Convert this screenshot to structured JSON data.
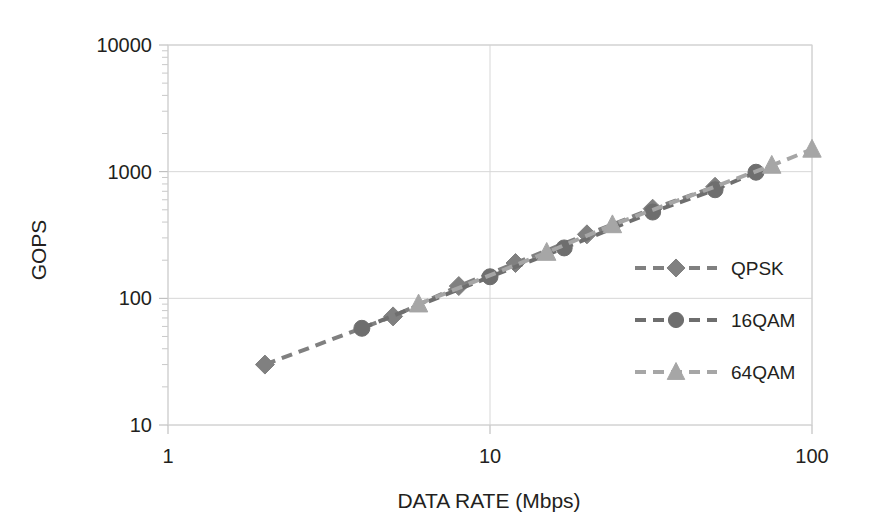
{
  "chart_data": {
    "type": "line",
    "title": "",
    "xlabel": "DATA RATE (Mbps)",
    "ylabel": "GOPS",
    "xscale": "log",
    "yscale": "log",
    "xlim": [
      1,
      100
    ],
    "ylim": [
      10,
      10000
    ],
    "xticks": [
      "1",
      "10",
      "100"
    ],
    "yticks": [
      "10",
      "100",
      "1000",
      "10000"
    ],
    "grid": true,
    "legend_position": "inside-right",
    "series": [
      {
        "name": "QPSK",
        "marker": "diamond",
        "color": "#808080",
        "linestyle": "dashed",
        "points": [
          {
            "x": 2,
            "y": 30
          },
          {
            "x": 5,
            "y": 72
          },
          {
            "x": 8,
            "y": 125
          },
          {
            "x": 12,
            "y": 190
          },
          {
            "x": 20,
            "y": 320
          },
          {
            "x": 32,
            "y": 510
          },
          {
            "x": 50,
            "y": 760
          }
        ]
      },
      {
        "name": "16QAM",
        "marker": "circle",
        "color": "#6e6e6e",
        "linestyle": "dashed",
        "points": [
          {
            "x": 4,
            "y": 58
          },
          {
            "x": 10,
            "y": 148
          },
          {
            "x": 17,
            "y": 250
          },
          {
            "x": 32,
            "y": 480
          },
          {
            "x": 50,
            "y": 720
          },
          {
            "x": 67,
            "y": 990
          }
        ]
      },
      {
        "name": "64QAM",
        "marker": "triangle",
        "color": "#a6a6a6",
        "linestyle": "dashed",
        "points": [
          {
            "x": 6,
            "y": 90
          },
          {
            "x": 15,
            "y": 230
          },
          {
            "x": 24,
            "y": 380
          },
          {
            "x": 75,
            "y": 1120
          },
          {
            "x": 100,
            "y": 1500
          }
        ]
      }
    ]
  },
  "legend": {
    "entries": [
      {
        "label": "QPSK"
      },
      {
        "label": "16QAM"
      },
      {
        "label": "64QAM"
      }
    ]
  },
  "axes": {
    "x_title": "DATA RATE (Mbps)",
    "y_title": "GOPS",
    "x_tick_labels": [
      "1",
      "10",
      "100"
    ],
    "y_tick_labels": [
      "10000",
      "1000",
      "100",
      "10"
    ]
  }
}
